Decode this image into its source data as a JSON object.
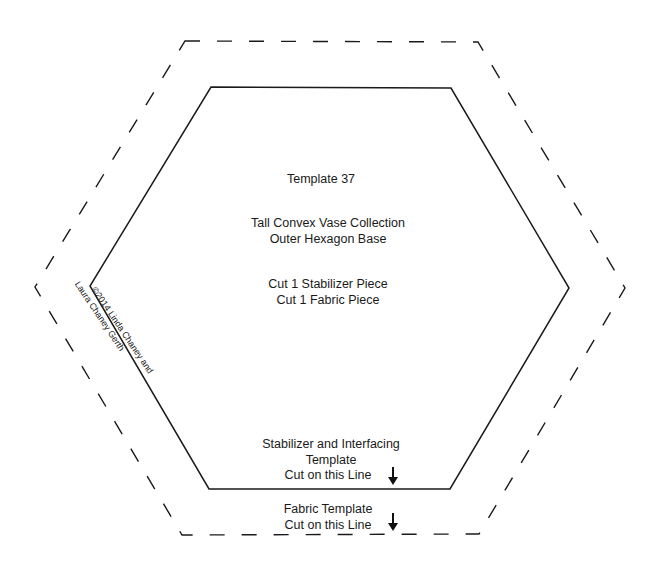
{
  "template": {
    "title": "Template 37",
    "collection": "Tall Convex Vase Collection",
    "piece_name": "Outer Hexagon Base",
    "cut_stabilizer": "Cut 1 Stabilizer Piece",
    "cut_fabric": "Cut 1 Fabric Piece"
  },
  "credit": {
    "line1": "©2014 Linda Chaney and",
    "line2": "Laura Chaney Gerth"
  },
  "inner_label": {
    "line1": "Stabilizer and Interfacing",
    "line2": "Template",
    "line3": "Cut on this Line",
    "arrow_icon": "down-arrow"
  },
  "outer_label": {
    "line1": "Fabric Template",
    "line2": "Cut on this Line",
    "arrow_icon": "down-arrow"
  },
  "colors": {
    "line": "#1a1a1a",
    "background": "#ffffff"
  },
  "shapes": {
    "inner_hexagon": {
      "style": "solid",
      "points": [
        [
          211,
          87
        ],
        [
          451,
          88
        ],
        [
          569,
          288
        ],
        [
          450,
          489
        ],
        [
          209,
          489
        ],
        [
          90,
          286
        ]
      ]
    },
    "outer_hexagon": {
      "style": "dashed",
      "points": [
        [
          185,
          41
        ],
        [
          478,
          42
        ],
        [
          625,
          288
        ],
        [
          479,
          534
        ],
        [
          182,
          535
        ],
        [
          35,
          287
        ]
      ]
    }
  }
}
